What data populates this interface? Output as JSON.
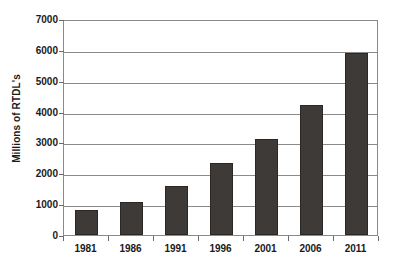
{
  "chart_data": {
    "type": "bar",
    "title": "",
    "subtitle": "",
    "xlabel": "",
    "ylabel": "Millions of RTDL's",
    "categories": [
      "1981",
      "1986",
      "1991",
      "1996",
      "2001",
      "2006",
      "2011"
    ],
    "values": [
      800,
      1080,
      1580,
      2320,
      3120,
      4200,
      5900
    ],
    "series": [
      {
        "name": "RTDL's",
        "values": [
          800,
          1080,
          1580,
          2320,
          3120,
          4200,
          5900
        ]
      }
    ],
    "ylim": [
      0,
      7000
    ],
    "ytick_values": [
      0,
      1000,
      2000,
      3000,
      4000,
      5000,
      6000,
      7000
    ],
    "ytick_labels": [
      "0",
      "1000",
      "2000",
      "3000",
      "4000",
      "5000",
      "6000",
      "7000"
    ],
    "grid": true,
    "grid_axis": "y",
    "legend": false,
    "legend_position": "none",
    "annotations": [],
    "colors": {
      "bar_fill": "#3d3a38",
      "bar_border": "#2a2725",
      "gridline": "#8a8a8a",
      "axis": "#6b6b6b",
      "text": "#1a1a1a",
      "plot_background": "#ffffff",
      "page_background": "#ffffff"
    }
  }
}
